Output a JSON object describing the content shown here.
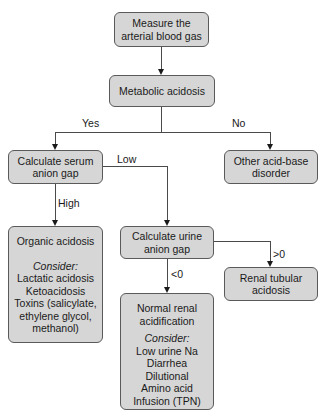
{
  "nodes": {
    "measure_abg": {
      "lines": [
        "Measure the",
        "arterial blood gas"
      ]
    },
    "metabolic_acidosis": {
      "lines": [
        "Metabolic acidosis"
      ]
    },
    "serum_anion_gap": {
      "lines": [
        "Calculate serum",
        "anion gap"
      ]
    },
    "other_disorder": {
      "lines": [
        "Other acid-base",
        "disorder"
      ]
    },
    "organic_acidosis": {
      "title": "Organic acidosis",
      "consider_label": "Consider:",
      "items": [
        "Lactatic acidosis",
        "Ketoacidosis",
        "Toxins (salicylate,",
        "ethylene glycol,",
        "methanol)"
      ]
    },
    "urine_anion_gap": {
      "lines": [
        "Calculate urine",
        "anion gap"
      ]
    },
    "renal_tubular": {
      "lines": [
        "Renal tubular",
        "acidosis"
      ]
    },
    "normal_renal": {
      "title_lines": [
        "Normal renal",
        "acidification"
      ],
      "consider_label": "Consider:",
      "items": [
        "Low urine Na",
        "Diarrhea",
        "Dilutional",
        "Amino acid",
        "Infusion (TPN)"
      ]
    }
  },
  "edge_labels": {
    "yes": "Yes",
    "no": "No",
    "low": "Low",
    "high": "High",
    "lt0": "<0",
    "gt0": ">0"
  }
}
